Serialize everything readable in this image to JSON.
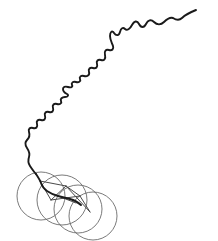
{
  "figure": {
    "width": 218,
    "height": 241,
    "background_color": "#ffffff"
  },
  "style": {
    "trace_color": "#1a1a1a",
    "trace_width": 1.9,
    "loop_color": "#6b6b6b",
    "loop_width": 0.9,
    "chord_color": "#4a4a4a",
    "chord_width": 1.0
  },
  "chart_data": {
    "type": "line",
    "title": "",
    "xlabel": "",
    "ylabel": "",
    "xlim": [
      0,
      218
    ],
    "ylim": [
      0,
      241
    ],
    "grid": false,
    "legend": null,
    "series": [
      {
        "name": "trajectory",
        "kind": "polyline",
        "stroke": "#1a1a1a",
        "points": [
          [
            196,
            10
          ],
          [
            192,
            12
          ],
          [
            188,
            14
          ],
          [
            184,
            16
          ],
          [
            181,
            19
          ],
          [
            178,
            20
          ],
          [
            175,
            19
          ],
          [
            172,
            18
          ],
          [
            169,
            19
          ],
          [
            166,
            21
          ],
          [
            163,
            23
          ],
          [
            160,
            24
          ],
          [
            157,
            24
          ],
          [
            155,
            22
          ],
          [
            153,
            20
          ],
          [
            151,
            19
          ],
          [
            149,
            20
          ],
          [
            147,
            23
          ],
          [
            145,
            26
          ],
          [
            143,
            27
          ],
          [
            141,
            26
          ],
          [
            139,
            23
          ],
          [
            137,
            21
          ],
          [
            135,
            21
          ],
          [
            133,
            24
          ],
          [
            131,
            27
          ],
          [
            129,
            29
          ],
          [
            127,
            30
          ],
          [
            125,
            29
          ],
          [
            124,
            27
          ],
          [
            123,
            25
          ],
          [
            122,
            25
          ],
          [
            121,
            27
          ],
          [
            120,
            30
          ],
          [
            119,
            33
          ],
          [
            118,
            35
          ],
          [
            116,
            35
          ],
          [
            114,
            33
          ],
          [
            113,
            31
          ],
          [
            132,
            31
          ],
          [
            130,
            33
          ]
        ]
      }
    ]
  },
  "trajectory": {
    "name": "main-trace",
    "path": "M196,10 C191,12 186,14 182,18 C179,21 176,20 173,18 C170,17 167,19 164,22 C161,25 157,25 154,22 C151,19 148,20 146,24 C144,28 141,28 139,24 C137,20 134,21 132,25 C130,29 127,31 125,29 C123,27 121,28 120,32 C119,36 116,36 114,33 C112,30 110,32 110,36 C110,40 112,43 113,46 C114,49 112,51 109,50 C106,49 104,51 105,55 C106,59 104,61 101,60 C98,59 96,61 97,64 C98,67 96,69 93,68 C90,67 88,69 89,72 C90,75 87,77 84,76 C81,75 79,77 80,79 C81,81 79,83 76,82 C73,81 71,83 72,85 C73,87 71,88 68,87 C65,86 63,87 63,89 C63,91 65,93 67,94 C69,95 68,97 65,97 C62,97 60,99 61,101 C62,103 60,105 57,104 C54,103 52,105 53,108 C54,111 52,113 49,112 C46,111 44,113 45,116 C46,119 44,121 41,120 C38,119 36,121 37,124 C38,127 36,129 33,128 C30,127 28,129 29,132 C30,135 29,138 27,140 C25,142 25,145 27,148 C29,151 30,154 29,157 C28,160 28,163 30,166 C32,169 34,172 36,174",
    "tail_path": "M36,174 C38,177 40,180 41,183 C42,186 44,189 47,191 C50,193 54,195 58,196 C62,197 66,198 70,199 C74,200 78,202 81,205",
    "spokes": [
      {
        "name": "spoke-1",
        "path": "M40,181 L66,186"
      },
      {
        "name": "spoke-2",
        "path": "M40,181 L51,200"
      },
      {
        "name": "spoke-3",
        "path": "M51,200 L66,186"
      },
      {
        "name": "spoke-4",
        "path": "M51,200 L80,196"
      },
      {
        "name": "spoke-5",
        "path": "M66,186 L80,196"
      },
      {
        "name": "spoke-6",
        "path": "M80,196 L90,212"
      },
      {
        "name": "spoke-7",
        "path": "M66,186 L90,212"
      },
      {
        "name": "spoke-8",
        "path": "M58,196 L76,203"
      }
    ],
    "loops": [
      {
        "name": "loop-1",
        "cx": 41,
        "cy": 196,
        "rx": 24,
        "ry": 24,
        "rotation": 0
      },
      {
        "name": "loop-2",
        "cx": 62,
        "cy": 200,
        "rx": 25,
        "ry": 25,
        "rotation": 0
      },
      {
        "name": "loop-3",
        "cx": 78,
        "cy": 209,
        "rx": 24,
        "ry": 24,
        "rotation": 0
      },
      {
        "name": "loop-4",
        "cx": 93,
        "cy": 216,
        "rx": 24,
        "ry": 24,
        "rotation": 0
      }
    ]
  }
}
